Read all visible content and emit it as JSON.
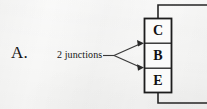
{
  "figure": {
    "item_label": "A.",
    "annotation": "2 junctions",
    "background_color": "#f7f7f6",
    "ink_color": "#1a1a1a"
  },
  "device_block": {
    "name": "transistor-terminal-stack",
    "cells": [
      {
        "id": "collector",
        "label": "C"
      },
      {
        "id": "base",
        "label": "B"
      },
      {
        "id": "emitter",
        "label": "E"
      }
    ],
    "box": {
      "x": 144,
      "y": 18,
      "width": 28,
      "height": 75
    },
    "dividers_y": [
      43,
      68
    ]
  },
  "wires": [
    {
      "name": "top-lead",
      "from_terminal": "C",
      "path": "vertical up then right to edge",
      "corner": {
        "x": 158,
        "y": 5
      },
      "end_x": 207
    },
    {
      "name": "bottom-lead",
      "from_terminal": "E",
      "path": "vertical down then right to edge",
      "corner": {
        "x": 158,
        "y": 103
      },
      "end_x": 207
    }
  ],
  "leader": {
    "name": "junction-leader",
    "fork_point": {
      "x": 114,
      "y": 55
    },
    "tail_start_x": 103,
    "arrow_targets": [
      {
        "label": "collector-base junction",
        "x": 144,
        "y": 43
      },
      {
        "label": "base-emitter junction",
        "x": 144,
        "y": 67
      }
    ]
  }
}
